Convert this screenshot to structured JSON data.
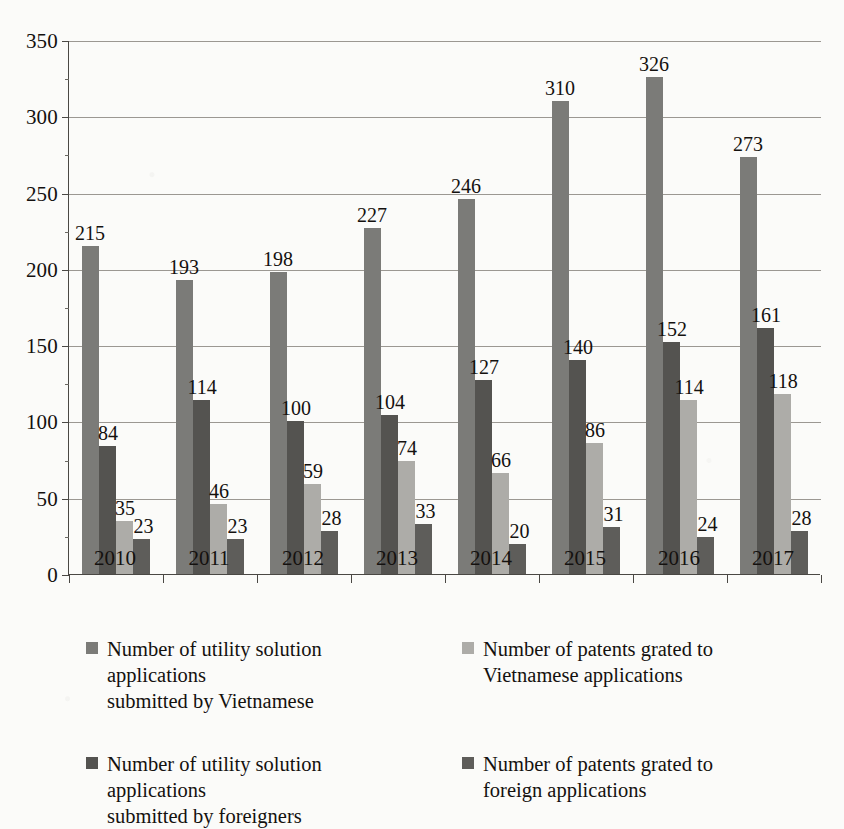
{
  "chart_data": {
    "type": "bar",
    "title": "",
    "subtitle": "",
    "xlabel": "",
    "ylabel": "",
    "categories": [
      "2010",
      "2011",
      "2012",
      "2013",
      "2014",
      "2015",
      "2016",
      "2017"
    ],
    "ylim": [
      0,
      350
    ],
    "ytick_step": 50,
    "yticks": [
      "0",
      "50",
      "100",
      "150",
      "200",
      "250",
      "300",
      "350"
    ],
    "grid": true,
    "legend_position": "bottom",
    "series": [
      {
        "name": "Number of utility solution applications submitted by Vietnamese",
        "color": "#7b7b78",
        "values": [
          215,
          193,
          198,
          227,
          246,
          310,
          326,
          273
        ]
      },
      {
        "name": "Number of utility solution applications submitted by foreigners",
        "color": "#545350",
        "values": [
          84,
          114,
          100,
          104,
          127,
          140,
          152,
          161
        ]
      },
      {
        "name": "Number of patents grated to Vietnamese applications",
        "color": "#adaca8",
        "values": [
          35,
          46,
          59,
          74,
          66,
          86,
          114,
          118
        ]
      },
      {
        "name": "Number of patents grated to foreign applications",
        "color": "#5e5d5a",
        "values": [
          23,
          23,
          28,
          33,
          20,
          31,
          24,
          28
        ]
      }
    ]
  },
  "legend": {
    "items": [
      {
        "line1": "Number of utility solution applications",
        "line2": "submitted by Vietnamese",
        "color": "#7b7b78"
      },
      {
        "line1": "Number of patents grated to",
        "line2": "Vietnamese applications",
        "color": "#adaca8"
      },
      {
        "line1": "Number of utility solution applications",
        "line2": "submitted by foreigners",
        "color": "#545350"
      },
      {
        "line1": "Number of patents grated to",
        "line2": "foreign applications",
        "color": "#5e5d5a"
      }
    ]
  },
  "axis": {
    "y_max": 350,
    "y_min": 0
  }
}
